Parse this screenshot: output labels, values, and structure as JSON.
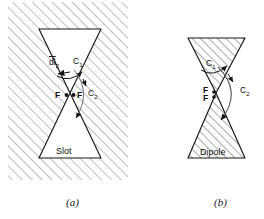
{
  "figure": {
    "type": "technical-diagram",
    "panels": [
      {
        "id": "a",
        "caption": "(a)",
        "structure_label": "Slot",
        "feed_labels": [
          "F",
          "F"
        ],
        "contours": [
          "C₁",
          "C₂"
        ],
        "vector_label": "dl̂2",
        "vector_text": "dl",
        "vector_sub": "2",
        "region": "hatched-conducting-sheet",
        "bowtie_fill": "white"
      },
      {
        "id": "b",
        "caption": "(b)",
        "structure_label": "Dipole",
        "feed_labels": [
          "F",
          "F"
        ],
        "contours": [
          "C₁",
          "C₂"
        ],
        "region": "free-space",
        "bowtie_fill": "hatched"
      }
    ],
    "labels": {
      "c1": "C",
      "c1_sub": "1",
      "c2": "C",
      "c2_sub": "2",
      "dl": "dl",
      "dl_sub": "2",
      "F": "F",
      "slot": "Slot",
      "dipole": "Dipole",
      "cap_a": "(a)",
      "cap_b": "(b)"
    },
    "colors": {
      "ink": "#161616",
      "hatch": "#8d8d8d",
      "background": "#ffffff"
    }
  }
}
